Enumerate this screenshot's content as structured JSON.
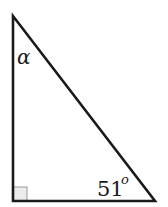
{
  "diagram": {
    "type": "right-triangle",
    "labels": {
      "top_angle": "α",
      "bottom_right_angle_value": "51",
      "bottom_right_angle_unit": "o"
    },
    "right_angle_marker": "bottom-left",
    "colors": {
      "stroke": "#1a1a1a",
      "right_angle_fill": "#ececec",
      "background": "#ffffff"
    }
  }
}
